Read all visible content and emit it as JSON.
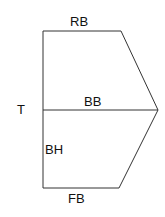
{
  "diagram": {
    "labels": {
      "top_edge": "RB",
      "middle_line": "BB",
      "left_point": "T",
      "left_lower_edge": "BH",
      "bottom_edge": "FB"
    },
    "stroke_color": "#333333",
    "background": "#ffffff"
  }
}
